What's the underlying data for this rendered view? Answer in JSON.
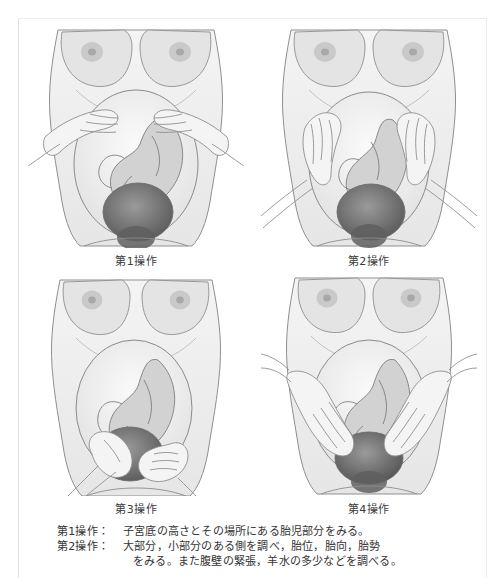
{
  "figure": {
    "frame_color": "#e6e6e6",
    "background_color": "#ffffff",
    "text_color": "#333333"
  },
  "panels": [
    {
      "id": "panel-1",
      "label": "第1操作",
      "maneuver_number": 1,
      "description_icon": "two-hands-at-fundus"
    },
    {
      "id": "panel-2",
      "label": "第2操作",
      "maneuver_number": 2,
      "description_icon": "two-hands-lateral-abdomen"
    },
    {
      "id": "panel-3",
      "label": "第3操作",
      "maneuver_number": 3,
      "description_icon": "one-hand-grasping-presenting-part"
    },
    {
      "id": "panel-4",
      "label": "第4操作",
      "maneuver_number": 4,
      "description_icon": "two-hands-toward-pelvic-inlet"
    }
  ],
  "caption": {
    "lines": [
      {
        "key": "第1操作：",
        "text": "子宮底の高さとその場所にある胎児部分をみる。",
        "indented": false
      },
      {
        "key": "第2操作：",
        "text": "大部分，小部分のある側を調べ，胎位，胎向，胎勢",
        "indented": false
      },
      {
        "key": "",
        "text": "をみる。また腹壁の緊張，羊水の多少などを調べる。",
        "indented": true
      }
    ]
  }
}
